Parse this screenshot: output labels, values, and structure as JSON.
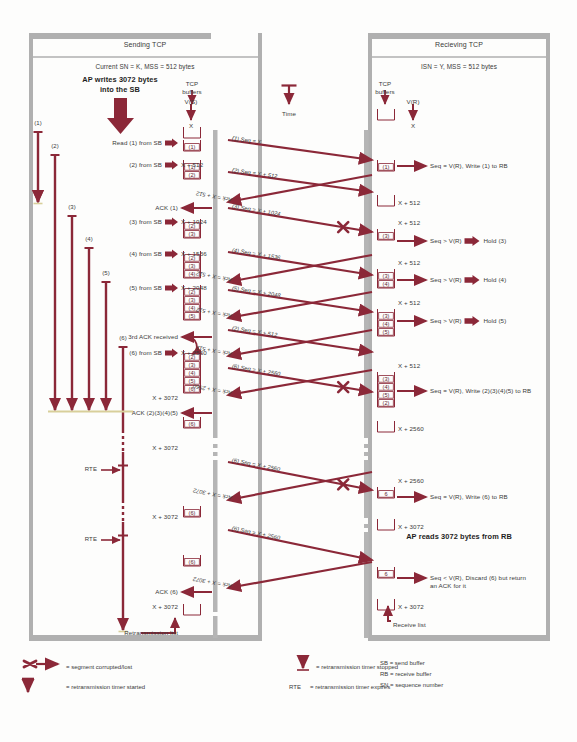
{
  "meta": {
    "accent": "#8B2838",
    "accent_soft": "#A2495A",
    "panel_border": "#9a9a9a",
    "box_stroke": "#8B2838",
    "text": "#3a3a3a",
    "width": 577,
    "height": 742
  },
  "panels": {
    "sending": {
      "title": "Sending TCP",
      "subtitle": "Current SN = K, MSS = 512 bytes",
      "ap_note": [
        "AP writes 3072 bytes",
        "into the SB"
      ],
      "vs_label": "V(S)",
      "vs_value": "X",
      "tcp_buffers_label": [
        "TCP",
        "buffers"
      ]
    },
    "receiving": {
      "title": "Recieving TCP",
      "subtitle": "ISN = Y, MSS = 512 bytes",
      "ap_note": "AP reads 3072 bytes from RB",
      "vr_label": "V(R)",
      "vr_value": "X",
      "tcp_buffers_label": [
        "TCP",
        "buffers"
      ],
      "receive_list": "Receive list"
    },
    "time_label": "Time"
  },
  "sender_events": [
    {
      "text": "Read (1) from SB",
      "y": 143,
      "arrow": true
    },
    {
      "text": "(2) from SB",
      "y": 165,
      "arrow": true,
      "value": "X + 512"
    },
    {
      "text": "ACK (1)",
      "y": 208,
      "ack": true
    },
    {
      "text": "(3) from SB",
      "y": 222,
      "arrow": true,
      "value": "X + 1024"
    },
    {
      "text": "(4) from SB",
      "y": 254,
      "arrow": true,
      "value": "X + 1536"
    },
    {
      "text": "(5) from SB",
      "y": 288,
      "arrow": true,
      "value": "X + 2048"
    },
    {
      "text": "3rd ACK received",
      "y": 337,
      "ack": true
    },
    {
      "text": "(6) from SB",
      "y": 353,
      "arrow": true,
      "value": "X + 2560"
    },
    {
      "text": "X + 3072",
      "y": 398,
      "plain": true
    },
    {
      "text": "ACK (2)(3)(4)(5)",
      "y": 413,
      "ack": true
    },
    {
      "text": "X + 3072",
      "y": 448,
      "plain": true
    },
    {
      "text": "X + 3072",
      "y": 517,
      "plain": true
    },
    {
      "text": "ACK (6)",
      "y": 592,
      "ack": true
    },
    {
      "text": "X + 3072",
      "y": 607,
      "plain": true
    },
    {
      "text": "Retransmission list",
      "y": 633,
      "plain": true
    }
  ],
  "sender_buffer_stacks": [
    {
      "y": 128,
      "items": []
    },
    {
      "y": 143,
      "items": [
        "(1)"
      ]
    },
    {
      "y": 163,
      "items": [
        "(2)",
        "(1)"
      ]
    },
    {
      "y": 222,
      "items": [
        "(3)",
        "(2)"
      ]
    },
    {
      "y": 254,
      "items": [
        "(4)",
        "(3)",
        "(2)"
      ]
    },
    {
      "y": 288,
      "items": [
        "(5)",
        "(4)",
        "(3)",
        "(2)"
      ]
    },
    {
      "y": 353,
      "items": [
        "(6)",
        "(5)",
        "(4)",
        "(3)",
        "(2)"
      ]
    },
    {
      "y": 420,
      "items": [
        "(6)"
      ]
    },
    {
      "y": 509,
      "items": [
        "(6)"
      ]
    },
    {
      "y": 558,
      "items": [
        "(6)"
      ]
    },
    {
      "y": 605,
      "items": []
    }
  ],
  "sender_timers": [
    {
      "label": "(1)",
      "x": 38,
      "top": 132,
      "bottom": 202,
      "stopped": true
    },
    {
      "label": "(2)",
      "x": 55,
      "top": 155,
      "bottom": 410,
      "stopped": false
    },
    {
      "label": "(3)",
      "x": 72,
      "top": 216,
      "bottom": 410,
      "stopped": false
    },
    {
      "label": "(4)",
      "x": 89,
      "top": 248,
      "bottom": 410,
      "stopped": false
    },
    {
      "label": "(5)",
      "x": 106,
      "top": 282,
      "bottom": 410,
      "stopped": false
    },
    {
      "label": "(6)",
      "x": 123,
      "top": 347,
      "bottom": 630,
      "stopped": true,
      "dashed": [
        {
          "from": 430,
          "to": 452
        },
        {
          "from": 500,
          "to": 522
        }
      ],
      "rte": [
        {
          "y": 470,
          "label": "RTE"
        },
        {
          "y": 540,
          "label": "RTE"
        }
      ]
    }
  ],
  "rte_markers": [
    {
      "label": "RTE",
      "y": 470
    },
    {
      "label": "RTE",
      "y": 540
    }
  ],
  "segments": [
    {
      "label": "(1) Seq = X",
      "x1": 228,
      "y1": 140,
      "x2": 372,
      "y2": 160,
      "dir": "right",
      "lost": false
    },
    {
      "label": "(2) Seq = X + 512",
      "x1": 228,
      "y1": 172,
      "x2": 372,
      "y2": 192,
      "dir": "right",
      "lost": false
    },
    {
      "label": "Ack = X + 512",
      "x1": 372,
      "y1": 175,
      "x2": 228,
      "y2": 202,
      "dir": "left",
      "lost": false
    },
    {
      "label": "(3) Seq = X + 1024",
      "x1": 228,
      "y1": 208,
      "x2": 372,
      "y2": 232,
      "dir": "right",
      "lost": true
    },
    {
      "label": "(4) Seq = X + 1536",
      "x1": 228,
      "y1": 252,
      "x2": 372,
      "y2": 275,
      "dir": "right",
      "lost": false
    },
    {
      "label": "Ack = X + 512",
      "x1": 372,
      "y1": 255,
      "x2": 228,
      "y2": 282,
      "dir": "left",
      "lost": false
    },
    {
      "label": "(5) Seq = X + 2048",
      "x1": 228,
      "y1": 290,
      "x2": 372,
      "y2": 312,
      "dir": "right",
      "lost": false
    },
    {
      "label": "Ack = X + 512",
      "x1": 372,
      "y1": 292,
      "x2": 228,
      "y2": 318,
      "dir": "left",
      "lost": false
    },
    {
      "label": "(2) Seq = X + 512",
      "x1": 228,
      "y1": 330,
      "x2": 372,
      "y2": 352,
      "dir": "right",
      "lost": false
    },
    {
      "label": "Ack = X + 512",
      "x1": 372,
      "y1": 330,
      "x2": 228,
      "y2": 356,
      "dir": "left",
      "lost": false
    },
    {
      "label": "(6) Seq = X + 2560",
      "x1": 228,
      "y1": 368,
      "x2": 372,
      "y2": 392,
      "dir": "right",
      "lost": true
    },
    {
      "label": "Ack = X + 2560",
      "x1": 372,
      "y1": 370,
      "x2": 228,
      "y2": 395,
      "dir": "left",
      "lost": false
    },
    {
      "label": "(6) Seq = X + 2560",
      "x1": 228,
      "y1": 462,
      "x2": 372,
      "y2": 490,
      "dir": "right",
      "lost": true
    },
    {
      "label": "Ack = X + 3072",
      "x1": 372,
      "y1": 472,
      "x2": 228,
      "y2": 500,
      "dir": "left",
      "lost": false
    },
    {
      "label": "(6) Seq = X + 2560",
      "x1": 228,
      "y1": 530,
      "x2": 372,
      "y2": 560,
      "dir": "right",
      "lost": false
    },
    {
      "label": "Ack = X + 3072",
      "x1": 372,
      "y1": 562,
      "x2": 228,
      "y2": 588,
      "dir": "left",
      "lost": false
    }
  ],
  "receiver_buffer_stacks": [
    {
      "y": 110,
      "items": []
    },
    {
      "y": 163,
      "items": [
        "(1)"
      ]
    },
    {
      "y": 196,
      "items": [],
      "value": "X + 512"
    },
    {
      "y": 232,
      "items": [
        "(3)"
      ],
      "value_above": "X + 512"
    },
    {
      "y": 272,
      "items": [
        "(4)",
        "(3)"
      ],
      "value_above": "X + 512"
    },
    {
      "y": 312,
      "items": [
        "(5)",
        "(4)",
        "(3)"
      ],
      "value_above": "X + 512"
    },
    {
      "y": 375,
      "items": [
        "(2)",
        "(5)",
        "(4)",
        "(3)"
      ],
      "value_above": "X + 512"
    },
    {
      "y": 422,
      "items": [],
      "value": "X + 2560"
    },
    {
      "y": 490,
      "items": [
        "6"
      ],
      "value_above": "X + 2560"
    },
    {
      "y": 520,
      "items": [],
      "value": "X + 3072"
    },
    {
      "y": 570,
      "items": [
        "6"
      ]
    },
    {
      "y": 600,
      "items": [],
      "value": "X + 3072"
    }
  ],
  "receiver_actions": [
    {
      "y": 166,
      "text": "Seq = V(R), Write (1) to RB",
      "hold": null
    },
    {
      "y": 241,
      "text": "Seq > V(R)",
      "hold": "Hold (3)"
    },
    {
      "y": 280,
      "text": "Seq > V(R)",
      "hold": "Hold (4)"
    },
    {
      "y": 321,
      "text": "Seq > V(R)",
      "hold": "Hold (5)"
    },
    {
      "y": 391,
      "text": "Seq = V(R), Write (2)(3)(4)(5) to RB",
      "hold": null
    },
    {
      "y": 497,
      "text": "Seq = V(R), Write (6) to RB",
      "hold": null
    },
    {
      "y": 578,
      "text": "Seq < V(R), Discard (6) but return",
      "text2": "an ACK for it",
      "hold": null
    }
  ],
  "legend": {
    "items_left": [
      {
        "icon": "cross-arrow",
        "text": "= segment corrupted/lost"
      },
      {
        "icon": "timer-start",
        "text": "= retransmission timer started"
      }
    ],
    "items_right": [
      {
        "icon": "timer-stop",
        "text": "= retransmission timer stopped"
      },
      {
        "icon": "rte-text",
        "prefix": "RTE",
        "text": "= retransmission timer expires"
      }
    ],
    "abbrev": [
      "SB = send buffer",
      "RB = receive buffer",
      "SN = sequence number"
    ]
  }
}
